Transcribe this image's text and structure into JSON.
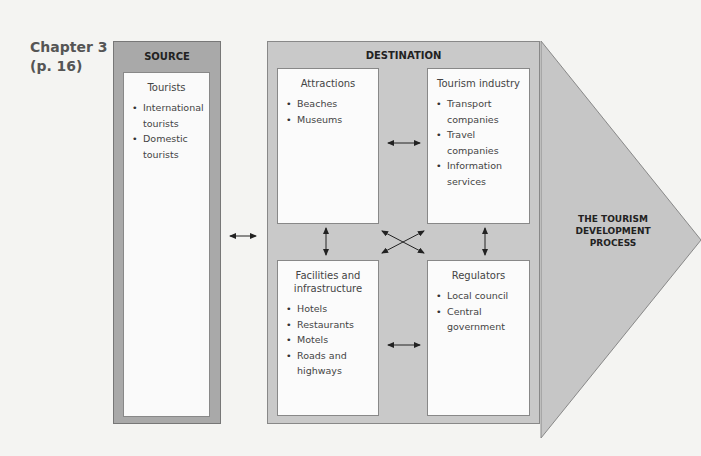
{
  "chapter_label": [
    "Chapter 3",
    "(p. 16)"
  ],
  "source": {
    "title": "SOURCE",
    "box": {
      "title": "Tourists",
      "items": [
        "International tourists",
        "Domestic tourists"
      ]
    }
  },
  "destination": {
    "title": "DESTINATION",
    "boxes": [
      {
        "title": "Attractions",
        "items": [
          "Beaches",
          "Museums"
        ]
      },
      {
        "title": "Tourism industry",
        "items": [
          "Transport companies",
          "Travel companies",
          "Information services"
        ]
      },
      {
        "title": "Facilities and infrastructure",
        "items": [
          "Hotels",
          "Restaurants",
          "Motels",
          "Roads and highways"
        ]
      },
      {
        "title": "Regulators",
        "items": [
          "Local council",
          "Central government"
        ]
      }
    ]
  },
  "process_arrow": {
    "label": [
      "THE TOURISM",
      "DEVELOPMENT",
      "PROCESS"
    ]
  },
  "colors": {
    "source_frame": "#a9a9a9",
    "destination_frame": "#c9c9c9",
    "arrow_fill": "#c6c6c6",
    "box_fill": "#fbfbfb"
  }
}
